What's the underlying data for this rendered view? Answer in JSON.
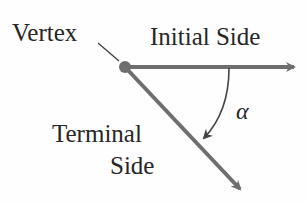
{
  "diagram": {
    "labels": {
      "vertex": "Vertex",
      "initial_side": "Initial Side",
      "terminal_side_line1": "Terminal",
      "terminal_side_line2": "Side",
      "angle": "α"
    },
    "colors": {
      "ray": "#6e6e6e",
      "text": "#262626",
      "leader": "#3a3a3a"
    },
    "geometry": {
      "vertex": [
        125,
        67
      ],
      "initial_end": [
        298,
        67
      ],
      "terminal_end": [
        244,
        194
      ],
      "arc_from": [
        229,
        67
      ],
      "arc_to": [
        201,
        140
      ]
    }
  }
}
